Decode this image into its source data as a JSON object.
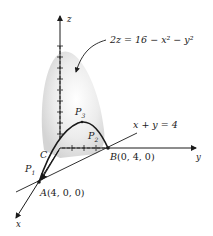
{
  "figure": {
    "equation": "2z = 16 − x² − y²",
    "plane_label": "x + y = 4",
    "axes": {
      "x": "x",
      "y": "y",
      "z": "z"
    },
    "points": {
      "A": {
        "name": "A",
        "coords": "(4, 0, 0)"
      },
      "B": {
        "name": "B",
        "coords": "(0, 4, 0)"
      },
      "C": {
        "name": "C"
      },
      "P1": {
        "name": "P",
        "sub": "1"
      },
      "P2": {
        "name": "P",
        "sub": "2"
      },
      "P3": {
        "name": "P",
        "sub": "3"
      }
    }
  }
}
